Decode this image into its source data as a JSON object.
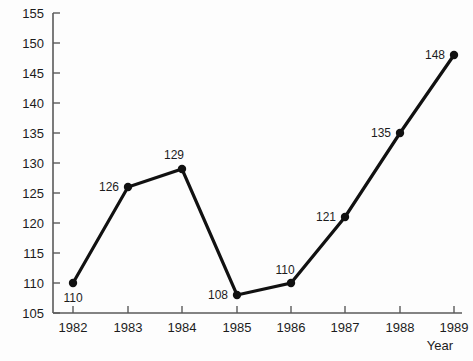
{
  "chart_data": {
    "type": "line",
    "title": "",
    "xlabel": "Year",
    "ylabel": "",
    "categories": [
      "1982",
      "1983",
      "1984",
      "1985",
      "1986",
      "1987",
      "1988",
      "1989"
    ],
    "values": [
      110,
      126,
      129,
      108,
      110,
      121,
      135,
      148
    ],
    "point_labels": [
      "110",
      "126",
      "129",
      "108",
      "110",
      "121",
      "135",
      "148"
    ],
    "ylim": [
      105,
      155
    ],
    "ytick_labels": [
      "105",
      "110",
      "115",
      "120",
      "125",
      "130",
      "135",
      "140",
      "145",
      "150",
      "155"
    ],
    "ytick_values": [
      105,
      110,
      115,
      120,
      125,
      130,
      135,
      140,
      145,
      150,
      155
    ],
    "xtick_labels": [
      "1982",
      "1983",
      "1984",
      "1985",
      "1986",
      "1987",
      "1988",
      "1989"
    ],
    "grid": false,
    "legend": "none",
    "marker": "filled-circle",
    "series_color": "#111111",
    "axis_color": "#5a5a5a",
    "text_color": "#1c1c1c",
    "background_color": "#fdfdfd",
    "label_offsets": [
      {
        "dx": 0,
        "dy": 19,
        "anchor": "middle"
      },
      {
        "dx": -9,
        "dy": 4,
        "anchor": "end"
      },
      {
        "dx": -8,
        "dy": -10,
        "anchor": "middle"
      },
      {
        "dx": -9,
        "dy": 4,
        "anchor": "end"
      },
      {
        "dx": -6,
        "dy": -9,
        "anchor": "middle"
      },
      {
        "dx": -9,
        "dy": 4,
        "anchor": "end"
      },
      {
        "dx": -9,
        "dy": 4,
        "anchor": "end"
      },
      {
        "dx": -9,
        "dy": 4,
        "anchor": "end"
      }
    ]
  },
  "geometry": {
    "plot_left": 53,
    "plot_right": 462,
    "plot_top": 13,
    "plot_bottom": 313,
    "x_positions": [
      73,
      128,
      182,
      237,
      291,
      345,
      400,
      454
    ],
    "tick_len": 7,
    "axis_label_x": 440,
    "axis_label_y": 350
  }
}
